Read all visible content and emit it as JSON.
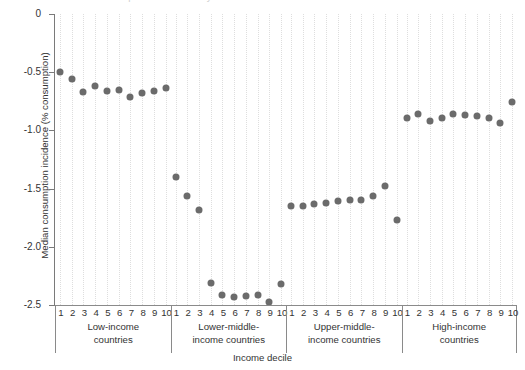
{
  "figure": {
    "cropped_title_fragment": "Median consumption incidence by income decile",
    "xlabel": "Income decile",
    "ylabel": "Median consumption incidence (% consumption)",
    "dot_color": "#6b6b6b",
    "axis_color": "#7a7a7a",
    "grid_color": "#dedede"
  },
  "chart_data": {
    "type": "scatter",
    "title": "",
    "xlabel": "Income decile",
    "ylabel": "Median consumption incidence (% consumption)",
    "ylim": [
      -2.5,
      0
    ],
    "yticks": [
      0,
      -0.5,
      -1.0,
      -1.5,
      -2.0,
      -2.5
    ],
    "ytick_labels": [
      "0",
      "-0.5",
      "-1.0",
      "-1.5",
      "-2.0",
      "-2.5"
    ],
    "grid": "vertical-dotted",
    "legend": "none",
    "categories": [
      "1",
      "2",
      "3",
      "4",
      "5",
      "6",
      "7",
      "8",
      "9",
      "10"
    ],
    "group_labels": [
      "Low-income countries",
      "Lower-middle-income countries",
      "Upper-middle-income countries",
      "High-income countries"
    ],
    "groups": [
      {
        "name": "Low-income\ncountries",
        "name_line1": "Low-income",
        "name_line2": "countries",
        "deciles": [
          "1",
          "2",
          "3",
          "4",
          "5",
          "6",
          "7",
          "8",
          "9",
          "10"
        ],
        "values": [
          -0.5,
          -0.56,
          -0.67,
          -0.62,
          -0.66,
          -0.65,
          -0.71,
          -0.68,
          -0.66,
          -0.64
        ]
      },
      {
        "name": "Lower-middle-income countries",
        "name_line1": "Lower-middle-",
        "name_line2": "income countries",
        "deciles": [
          "1",
          "2",
          "3",
          "4",
          "5",
          "6",
          "7",
          "8",
          "9",
          "10"
        ],
        "values": [
          -1.4,
          -1.56,
          -1.68,
          -2.31,
          -2.41,
          -2.43,
          -2.42,
          -2.41,
          -2.47,
          -2.32
        ]
      },
      {
        "name": "Upper-middle-income countries",
        "name_line1": "Upper-middle-",
        "name_line2": "income countries",
        "deciles": [
          "1",
          "2",
          "3",
          "4",
          "5",
          "6",
          "7",
          "8",
          "9",
          "10"
        ],
        "values": [
          -1.65,
          -1.65,
          -1.63,
          -1.62,
          -1.61,
          -1.6,
          -1.6,
          -1.56,
          -1.48,
          -1.77
        ]
      },
      {
        "name": "High-income countries",
        "name_line1": "High-income",
        "name_line2": "countries",
        "deciles": [
          "1",
          "2",
          "3",
          "4",
          "5",
          "6",
          "7",
          "8",
          "9",
          "10"
        ],
        "values": [
          -0.89,
          -0.86,
          -0.92,
          -0.89,
          -0.86,
          -0.87,
          -0.88,
          -0.89,
          -0.94,
          -0.76
        ]
      }
    ]
  }
}
